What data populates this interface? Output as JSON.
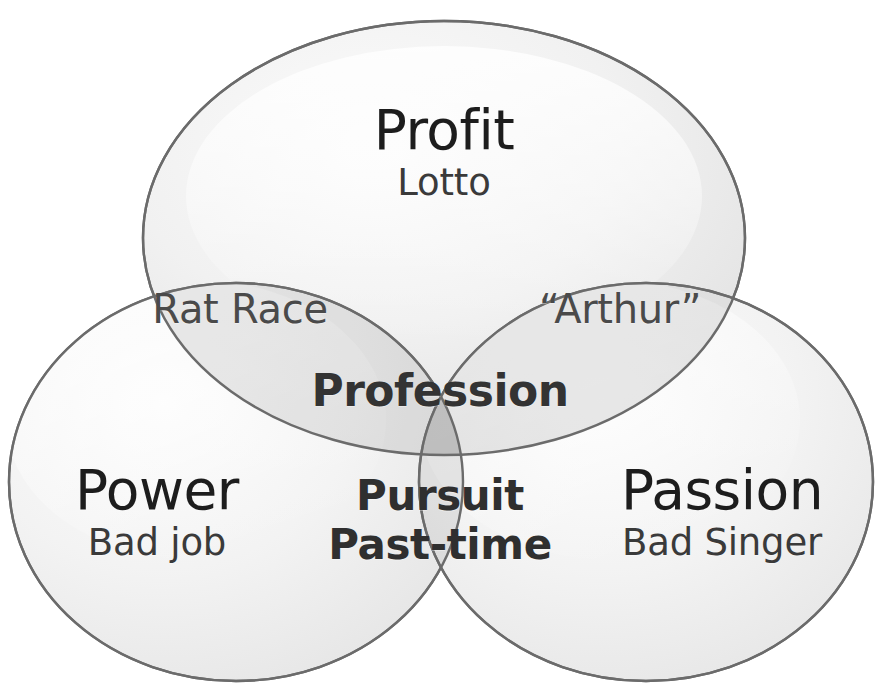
{
  "diagram": {
    "type": "venn-3-set",
    "background_color": "#ffffff",
    "ellipse_fill_light": "#f2f2f2",
    "ellipse_fill_shade": "#d8d8d8",
    "ellipse_stroke": "#6e6e6e",
    "overlap_tint": "#b9b9b9",
    "text_color": "#2a2a2a"
  },
  "sets": {
    "top": {
      "name": "Profit",
      "example": "Lotto",
      "position": "top-center"
    },
    "left": {
      "name": "Power",
      "example": "Bad job",
      "position": "bottom-left"
    },
    "right": {
      "name": "Passion",
      "example": "Bad Singer",
      "position": "bottom-right"
    }
  },
  "intersections": {
    "profit_power": {
      "label": "Rat Race",
      "sets": "Profit + Power"
    },
    "profit_passion": {
      "label": "“Arthur”",
      "sets": "Profit + Passion"
    },
    "all_three": {
      "label": "Profession",
      "sets": "Profit + Power + Passion"
    },
    "power_passion": {
      "label_line1": "Pursuit",
      "label_line2": "Past-time",
      "sets": "Power + Passion"
    }
  }
}
